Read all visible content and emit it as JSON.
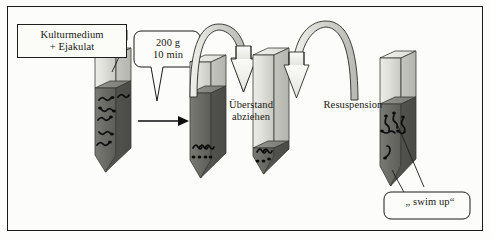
{
  "figure": {
    "language": "de",
    "frame_border_color": "#1a1a1a",
    "background_color": "#fcfcfa"
  },
  "labels": {
    "culture_medium": "Kulturmedium\n+ Ejakulat",
    "centrifugation": "200 g\n10 min",
    "remove_supernatant": "Überstand\nabziehen",
    "resuspension": "Resuspension",
    "swim_up": "„ swim up“"
  },
  "steps": [
    {
      "id": "step-1",
      "tube_name": "tube-sample",
      "top_label": "Kulturmedium\n+ Ejakulat",
      "upper_layer": "Kulturmedium",
      "lower_layer": "Ejakulat",
      "sperm_count": 6,
      "sperm_location": "distributed in lower dark layer"
    },
    {
      "id": "step-2",
      "tube_name": "tube-after-centrifugation",
      "upper_layer": "Überstand",
      "lower_layer": "Pellet",
      "sperm_count": 4,
      "sperm_location": "pelleted at tip"
    },
    {
      "id": "step-3",
      "tube_name": "tube-supernatant-removed",
      "upper_layer": "leer",
      "lower_layer": "Pellet",
      "sperm_count": 3,
      "sperm_location": "pellet at tip only"
    },
    {
      "id": "step-4",
      "tube_name": "tube-resuspended",
      "upper_layer": "Kulturmedium",
      "lower_layer": "Resuspension",
      "sperm_count": 6,
      "sperm_location": "swimming upward"
    }
  ],
  "arrows": [
    {
      "name": "straight-arrow-centrifuge",
      "type": "straight",
      "direction": "right"
    },
    {
      "name": "curved-arrow-remove-supernatant",
      "type": "curved",
      "direction": "down-right"
    },
    {
      "name": "curved-arrow-resuspension",
      "type": "curved",
      "direction": "down-left"
    }
  ],
  "colors": {
    "tube_light": "#d8d8d2",
    "tube_light_top": "#ecece8",
    "tube_dark": "#6e6e6a",
    "tube_dark_top": "#8a8a85",
    "outline": "#2a2a26",
    "sperm": "#101010",
    "arrow_fill": "#f2f2ee"
  }
}
